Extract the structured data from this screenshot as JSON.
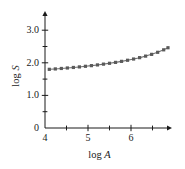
{
  "chart_data": {
    "type": "line",
    "title": "",
    "subtitle": "",
    "xlabel": "log A",
    "ylabel": "log S",
    "xlabel_prefix": "log",
    "xlabel_variable": "A",
    "ylabel_prefix": "log",
    "ylabel_variable": "S",
    "xlim": [
      4.0,
      7.0
    ],
    "ylim": [
      0.0,
      3.25
    ],
    "x_major_ticks": [
      4,
      5,
      6
    ],
    "x_major_tick_labels": [
      "4",
      "5",
      "6"
    ],
    "x_minor_ticks": [
      4.5,
      5.5,
      6.5
    ],
    "y_major_ticks": [
      0,
      1.0,
      2.0,
      3.0
    ],
    "y_major_tick_labels": [
      "0",
      "1.0",
      "2.0",
      "3.0"
    ],
    "y_minor_ticks": [
      0.5,
      1.5,
      2.5
    ],
    "grid": false,
    "legend": null,
    "legend_position": "none",
    "marker": "square",
    "marker_size": 1.6,
    "line_color": "#6e6e6e",
    "marker_color": "#5a5a5a",
    "axis_color": "#1a1a1a",
    "background_color": "#ffffff",
    "series": [
      {
        "name": "log S vs log A",
        "x": [
          4.1,
          4.24,
          4.38,
          4.52,
          4.66,
          4.8,
          4.94,
          5.08,
          5.22,
          5.36,
          5.5,
          5.64,
          5.78,
          5.92,
          6.06,
          6.2,
          6.34,
          6.48,
          6.62,
          6.76,
          6.86
        ],
        "values": [
          1.8,
          1.812,
          1.826,
          1.841,
          1.857,
          1.874,
          1.893,
          1.913,
          1.935,
          1.959,
          1.985,
          2.013,
          2.044,
          2.078,
          2.116,
          2.158,
          2.205,
          2.259,
          2.322,
          2.398,
          2.462
        ]
      }
    ],
    "annotations": []
  }
}
